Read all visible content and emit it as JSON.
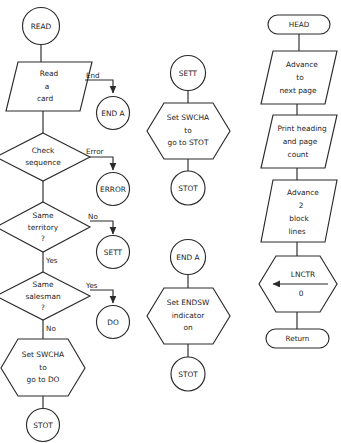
{
  "diagram": {
    "stroke_color": "#2b2b2b",
    "fill_color": "#ffffff",
    "text_color": "#1c1c1c",
    "columns": [
      {
        "name": "read-routine",
        "nodes": [
          {
            "id": "read-start",
            "type": "connector",
            "lines": [
              "READ"
            ]
          },
          {
            "id": "read-a-card",
            "type": "input-output",
            "lines": [
              "Read",
              "a",
              "card"
            ]
          },
          {
            "id": "end-a-connector",
            "type": "connector",
            "lines": [
              "END  A"
            ]
          },
          {
            "id": "check-sequence",
            "type": "decision",
            "lines": [
              "Check",
              "sequence"
            ]
          },
          {
            "id": "error-connector",
            "type": "connector",
            "lines": [
              "ERROR"
            ]
          },
          {
            "id": "same-territory",
            "type": "decision",
            "lines": [
              "Same",
              "territory",
              "?"
            ]
          },
          {
            "id": "sett-connector",
            "type": "connector",
            "lines": [
              "SETT"
            ]
          },
          {
            "id": "same-salesman",
            "type": "decision",
            "lines": [
              "Same",
              "salesman",
              "?"
            ]
          },
          {
            "id": "do-connector",
            "type": "connector",
            "lines": [
              "DO"
            ]
          },
          {
            "id": "set-swcha-do",
            "type": "preparation",
            "lines": [
              "Set SWCHA",
              "to",
              "go to DO"
            ]
          },
          {
            "id": "stot-connector-1",
            "type": "connector",
            "lines": [
              "STOT"
            ]
          }
        ],
        "branch_labels": [
          {
            "id": "label-end",
            "text": "End"
          },
          {
            "id": "label-error",
            "text": "Error"
          },
          {
            "id": "label-no-1",
            "text": "No"
          },
          {
            "id": "label-yes-1",
            "text": "Yes"
          },
          {
            "id": "label-yes-2",
            "text": "Yes"
          },
          {
            "id": "label-no-2",
            "text": "No"
          }
        ]
      },
      {
        "name": "sett-and-end-routines",
        "nodes": [
          {
            "id": "sett-start",
            "type": "connector",
            "lines": [
              "SETT"
            ]
          },
          {
            "id": "set-swcha-stot",
            "type": "preparation",
            "lines": [
              "Set SWCHA",
              "to",
              "go to STOT"
            ]
          },
          {
            "id": "stot-connector-2",
            "type": "connector",
            "lines": [
              "STOT"
            ]
          },
          {
            "id": "end-a-start",
            "type": "connector",
            "lines": [
              "END  A"
            ]
          },
          {
            "id": "set-endsw",
            "type": "preparation",
            "lines": [
              "Set ENDSW",
              "indicator",
              "on"
            ]
          },
          {
            "id": "stot-connector-3",
            "type": "connector",
            "lines": [
              "STOT"
            ]
          }
        ]
      },
      {
        "name": "head-routine",
        "nodes": [
          {
            "id": "head-start",
            "type": "terminal",
            "lines": [
              "HEAD"
            ]
          },
          {
            "id": "advance-page",
            "type": "input-output",
            "lines": [
              "Advance",
              "to",
              "next page"
            ]
          },
          {
            "id": "print-heading",
            "type": "input-output",
            "lines": [
              "Print heading",
              "and page",
              "count"
            ]
          },
          {
            "id": "advance-lines",
            "type": "input-output",
            "lines": [
              "Advance",
              "2",
              "block",
              "lines"
            ]
          },
          {
            "id": "lnctr-reset",
            "type": "preparation",
            "lines": [
              "LNCTR",
              "0"
            ],
            "has_left_arrow": true
          },
          {
            "id": "return-end",
            "type": "terminal",
            "lines": [
              "Return"
            ]
          }
        ]
      }
    ]
  }
}
